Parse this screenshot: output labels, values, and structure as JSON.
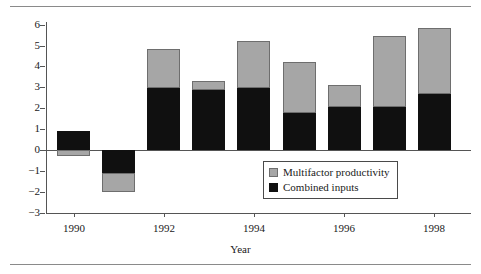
{
  "chart_data": {
    "type": "bar",
    "stacked": true,
    "title": "",
    "xlabel": "Year",
    "ylabel": "",
    "categories": [
      1990,
      1991,
      1992,
      1993,
      1994,
      1995,
      1996,
      1997,
      1998
    ],
    "xtick_labels": [
      "1990",
      "1992",
      "1994",
      "1996",
      "1998"
    ],
    "xtick_values": [
      1990,
      1992,
      1994,
      1996,
      1998
    ],
    "ytick_labels": [
      "6",
      "5",
      "4",
      "3",
      "2",
      "1",
      "0",
      "−1",
      "−2",
      "−3"
    ],
    "ytick_values": [
      6,
      5,
      4,
      3,
      2,
      1,
      0,
      -1,
      -2,
      -3
    ],
    "ylim": [
      -3,
      6
    ],
    "grid": false,
    "legend_position": "inside-lower-right",
    "series": [
      {
        "name": "Multifactor productivity",
        "color": "#a6a6a6",
        "values": [
          -0.3,
          -0.9,
          1.85,
          0.42,
          2.25,
          2.45,
          1.06,
          3.4,
          3.15
        ]
      },
      {
        "name": "Combined inputs",
        "color": "#101010",
        "values": [
          0.9,
          -1.1,
          3.0,
          2.86,
          2.95,
          1.76,
          2.05,
          2.05,
          2.67
        ]
      }
    ],
    "totals": [
      0.6,
      -2.0,
      4.85,
      3.28,
      5.2,
      4.21,
      3.11,
      5.45,
      5.82
    ]
  },
  "legend": {
    "items": [
      {
        "label": "Multifactor productivity",
        "color": "#a6a6a6"
      },
      {
        "label": "Combined inputs",
        "color": "#101010"
      }
    ]
  },
  "axes": {
    "x_title": "Year"
  }
}
